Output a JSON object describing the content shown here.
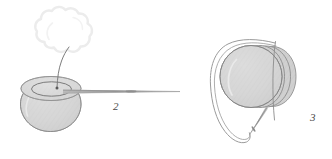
{
  "figure": {
    "background_color": "#ffffff",
    "width": 332,
    "height": 159,
    "palette": {
      "sphere_fill": "#d5d5d5",
      "sphere_fill_light": "#dddddd",
      "sphere_fill_lobe": "#cfcfcf",
      "outline": "#8a8a8a",
      "outline_soft": "#a8a8a8",
      "cloud_outline": "#ececec",
      "thread": "#7d7d7d",
      "needle": "#9a9a9a",
      "label_color": "#4a4a4a"
    },
    "items": [
      {
        "id": "item-2",
        "label": "2",
        "label_x": 113,
        "label_y": 110,
        "description": "Hatched sphere with open rim on top, thread rising into a puffy cloud, and a long needle entering from the right"
      },
      {
        "id": "item-3",
        "label": "3",
        "label_x": 310,
        "label_y": 121,
        "description": "Layered sphere of overlapping lobes encircled by a looped double thread with a needle at the lower end"
      }
    ],
    "parts": {
      "cloud": "cloud-shape",
      "left_sphere": "sphere-body",
      "left_rim": "rim-ellipse",
      "left_thread": "thread-curve",
      "left_needle": "needle-long",
      "right_sphere": "sphere-body",
      "right_lobes": "sphere-lobes",
      "right_loop": "thread-loop",
      "right_needle": "needle-short",
      "right_axis": "axis-line"
    }
  }
}
